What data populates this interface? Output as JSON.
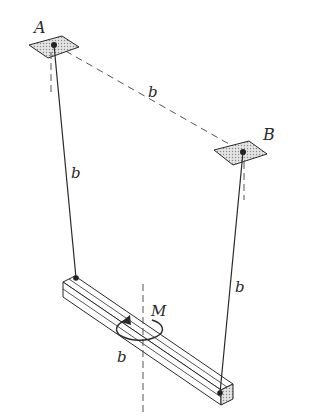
{
  "figure": {
    "labels": {
      "support_a": "A",
      "support_b": "B",
      "distance_ab": "b",
      "cable_a_length": "b",
      "cable_b_length": "b",
      "bar_length": "b",
      "moment": "M"
    },
    "colors": {
      "line": "#2a2a2a",
      "plate_fill": "#c8c8c8",
      "end_face_fill": "#d9d9d9",
      "background": "#ffffff"
    }
  }
}
